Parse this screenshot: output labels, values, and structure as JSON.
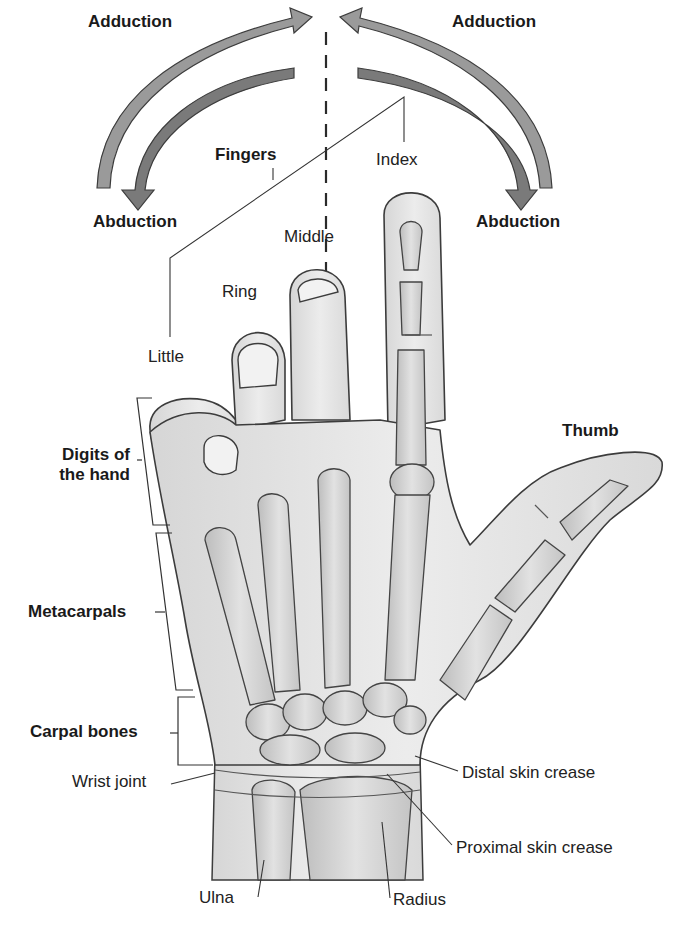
{
  "diagram": {
    "movement_labels": {
      "adduction_left": "Adduction",
      "adduction_right": "Adduction",
      "abduction_left": "Abduction",
      "abduction_right": "Abduction"
    },
    "finger_labels": {
      "group": "Fingers",
      "index": "Index",
      "middle": "Middle",
      "ring": "Ring",
      "little": "Little",
      "thumb": "Thumb"
    },
    "region_labels": {
      "digits_line1": "Digits of",
      "digits_line2": "the hand",
      "metacarpals": "Metacarpals",
      "carpal_bones": "Carpal bones",
      "wrist_joint": "Wrist joint"
    },
    "wrist_labels": {
      "distal_crease": "Distal skin crease",
      "proximal_crease": "Proximal skin crease",
      "ulna": "Ulna",
      "radius": "Radius"
    },
    "colors": {
      "arrow_fill": "#8f8f8f",
      "arrow_dark": "#6e6e6e",
      "outline": "#3c3c3c",
      "skin": "#e4e4e4",
      "bone": "#d2d2d2",
      "background": "#ffffff"
    }
  }
}
